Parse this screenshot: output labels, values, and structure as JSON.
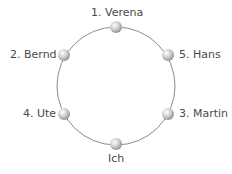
{
  "diagram": {
    "type": "seating-circle",
    "circle": {
      "cx": 116,
      "cy": 86,
      "r": 60,
      "stroke": "#8a8a8a"
    },
    "nodes": [
      {
        "id": "verena",
        "label": "1. Verena",
        "x": 116,
        "y": 27,
        "label_pos": "top"
      },
      {
        "id": "bernd",
        "label": "2. Bernd",
        "x": 64,
        "y": 55,
        "label_pos": "left"
      },
      {
        "id": "hans",
        "label": "5. Hans",
        "x": 168,
        "y": 55,
        "label_pos": "right"
      },
      {
        "id": "ute",
        "label": "4. Ute",
        "x": 64,
        "y": 114,
        "label_pos": "left"
      },
      {
        "id": "martin",
        "label": "3. Martin",
        "x": 168,
        "y": 114,
        "label_pos": "right"
      },
      {
        "id": "ich",
        "label": "Ich",
        "x": 116,
        "y": 144,
        "label_pos": "bottom"
      }
    ]
  }
}
